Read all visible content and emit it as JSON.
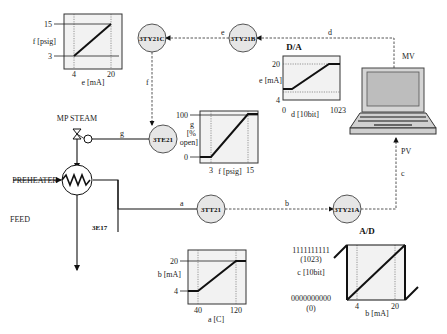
{
  "instruments": {
    "tt": "3TT21",
    "ty_a": "3TY21A",
    "ty_b": "3TY21B",
    "ty_c": "3TY21C",
    "te": "3TE21"
  },
  "process": {
    "steam": "MP STEAM",
    "preheater": "PREHEATER",
    "feed": "FEED",
    "exchanger": "3E17"
  },
  "signals": {
    "a": "a",
    "b": "b",
    "c": "c",
    "d": "d",
    "e": "e",
    "f": "f",
    "g": "g"
  },
  "computer": {
    "mv": "MV",
    "pv": "PV"
  },
  "titles": {
    "da": "D/A",
    "ad": "A/D"
  },
  "plots": {
    "ei_to_f": {
      "ylabel": "f [psig]",
      "xlabel": "e [mA]",
      "y_hi": "15",
      "y_lo": "3",
      "x_lo": "4",
      "x_hi": "20"
    },
    "da": {
      "ylabel": "e [mA]",
      "xlabel": "d [10bit]",
      "y_hi": "20",
      "y_lo": "4",
      "x_lo": "0",
      "x_hi": "1023"
    },
    "valve": {
      "ylabel1": "g",
      "ylabel2": "[%",
      "ylabel3": "open]",
      "xlabel": "f [psig]",
      "y_hi": "100",
      "y_lo": "0",
      "x_lo": "3",
      "x_hi": "15"
    },
    "tt": {
      "ylabel": "b [mA]",
      "xlabel": "a [C]",
      "y_hi": "20",
      "y_lo": "4",
      "x_lo": "40",
      "x_hi": "120"
    },
    "ad": {
      "ylabel": "c [10bit]",
      "xlabel": "b [mA]",
      "y_hi": "1111111111",
      "y_hi2": "(1023)",
      "y_lo": "0000000000",
      "y_lo2": "(0)",
      "x_lo": "4",
      "x_hi": "20"
    }
  }
}
